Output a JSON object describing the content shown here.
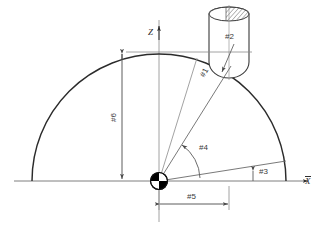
{
  "diagram": {
    "type": "technical-drawing",
    "colors": {
      "line": "#333333",
      "thin_line": "#777777",
      "text": "#3a3a3a",
      "background": "#ffffff",
      "marker_fill": "#000000"
    },
    "axes": {
      "x_label": "X",
      "z_label": "Z",
      "x_overline": true,
      "z_overline": false
    },
    "labels": [
      {
        "id": "p1",
        "text": "#1",
        "meaning": "radius-to-contact-point",
        "x": 206,
        "y": 82,
        "rotation": -62
      },
      {
        "id": "p2",
        "text": "#2",
        "meaning": "tool-nose-radius",
        "x": 228,
        "y": 38,
        "rotation": 0
      },
      {
        "id": "p3",
        "text": "#3",
        "meaning": "end-angle",
        "x": 262,
        "y": 172,
        "rotation": 0
      },
      {
        "id": "p4",
        "text": "#4",
        "meaning": "current-angle",
        "x": 203,
        "y": 149,
        "rotation": 0
      },
      {
        "id": "p5",
        "text": "#5",
        "meaning": "x-offset-distance",
        "x": 194,
        "y": 200,
        "rotation": 0
      },
      {
        "id": "p6",
        "text": "#6",
        "meaning": "dome-height",
        "x": 113,
        "y": 116,
        "rotation": -90
      }
    ],
    "geometry": {
      "origin": {
        "x": 159,
        "y": 181
      },
      "dome_apex": {
        "x": 159,
        "y": 55
      },
      "dome_left_base": {
        "x": 32,
        "y": 181
      },
      "dome_right_base": {
        "x": 285,
        "y": 181
      },
      "dome_radius": 127,
      "contact_point": {
        "x": 229,
        "y": 71
      },
      "tool": {
        "x": 206,
        "y": 7,
        "width": 46,
        "height": 70,
        "hatched_cap": true
      },
      "angle_4_degrees": 56,
      "angle_3_degrees": 9,
      "x_axis_y": 181,
      "z_axis_x": 159
    },
    "annotations": {
      "has_dimension_arrows": true,
      "has_angle_arc": true,
      "has_centerline_marker": true
    }
  }
}
